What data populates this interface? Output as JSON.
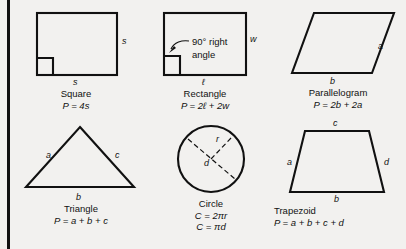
{
  "page": {
    "background_color": "#f2f1ef",
    "ink_color": "#111111",
    "spine_rule": "vertical-black-rule-left-edge"
  },
  "figures": [
    {
      "id": "square",
      "name": "Square",
      "formula": "P = 4s",
      "side_labels": [
        {
          "key": "right",
          "text": "s"
        },
        {
          "key": "bottom",
          "text": "s"
        }
      ],
      "marks": [
        "right-angle-box-bottom-left"
      ]
    },
    {
      "id": "rectangle",
      "name": "Rectangle",
      "formula": "P = 2ℓ + 2w",
      "side_labels": [
        {
          "key": "right",
          "text": "w"
        },
        {
          "key": "bottom",
          "text": "ℓ"
        }
      ],
      "annotation": {
        "line1": "90° right",
        "line2": "angle",
        "pointer": "curved-leader-to-right-angle-box"
      },
      "marks": [
        "right-angle-box-bottom-left"
      ]
    },
    {
      "id": "parallelogram",
      "name": "Parallelogram",
      "formula": "P = 2b + 2a",
      "side_labels": [
        {
          "key": "right",
          "text": "a"
        },
        {
          "key": "bottom",
          "text": "b"
        }
      ]
    },
    {
      "id": "triangle",
      "name": "Triangle",
      "formula": "P = a + b + c",
      "side_labels": [
        {
          "key": "left",
          "text": "a"
        },
        {
          "key": "right",
          "text": "c"
        },
        {
          "key": "bottom",
          "text": "b"
        }
      ]
    },
    {
      "id": "circle",
      "name": "Circle",
      "formula": "C = 2πr",
      "formula2": "C = πd",
      "side_labels": [
        {
          "key": "radius",
          "text": "r"
        },
        {
          "key": "diameter",
          "text": "d"
        }
      ],
      "marks": [
        "dashed-radius",
        "dashed-diameter"
      ]
    },
    {
      "id": "trapezoid",
      "name": "Trapezoid",
      "formula": "P = a + b + c + d",
      "side_labels": [
        {
          "key": "top",
          "text": "c"
        },
        {
          "key": "left",
          "text": "a"
        },
        {
          "key": "right",
          "text": "d"
        },
        {
          "key": "bottom",
          "text": "b"
        }
      ]
    }
  ]
}
